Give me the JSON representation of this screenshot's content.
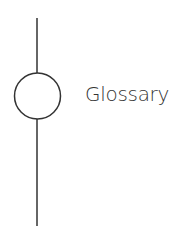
{
  "node": {
    "label": "Glossary",
    "icon": "circle-node"
  },
  "colors": {
    "stroke": "#333333",
    "text": "#333333",
    "background": "#ffffff"
  }
}
